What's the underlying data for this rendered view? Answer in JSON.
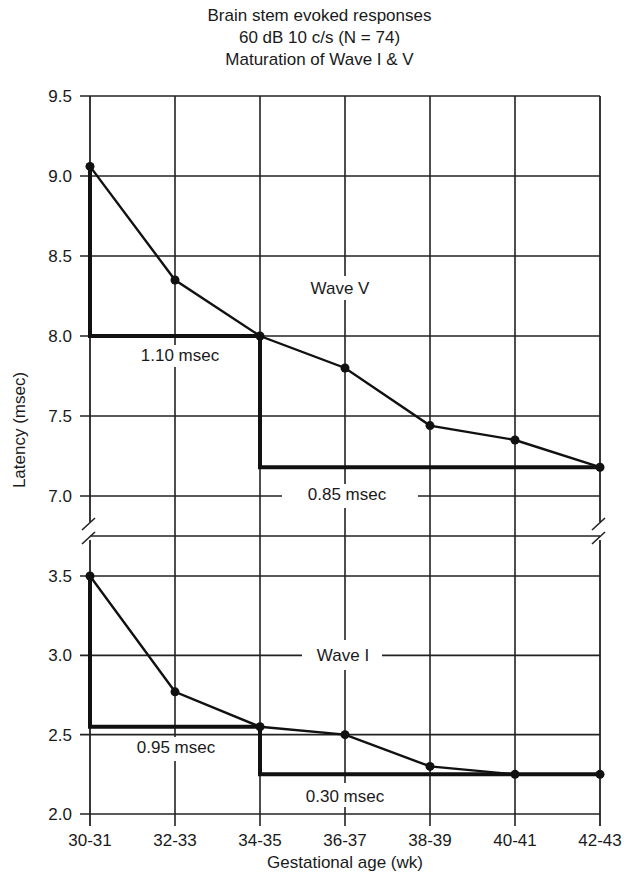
{
  "title": {
    "line1": "Brain stem evoked responses",
    "line2": "60 dB   10 c/s   (N = 74)",
    "line3": "Maturation of Wave I & V"
  },
  "axes": {
    "xlabel": "Gestational age (wk)",
    "ylabel": "Latency (msec)"
  },
  "annotations": {
    "wave_v_label": "Wave V",
    "wave_i_label": "Wave I",
    "wave_v_early_diff": "1.10 msec",
    "wave_v_late_diff": "0.85 msec",
    "wave_i_early_diff": "0.95 msec",
    "wave_i_late_diff": "0.30 msec"
  },
  "colors": {
    "line": "#111111",
    "grid": "#222222",
    "background": "#ffffff"
  },
  "chart_data": {
    "type": "line",
    "xlabel": "Gestational age (wk)",
    "ylabel": "Latency (msec)",
    "categories": [
      "30-31",
      "32-33",
      "34-35",
      "36-37",
      "38-39",
      "40-41",
      "42-43"
    ],
    "series": [
      {
        "name": "Wave V",
        "values": [
          9.06,
          8.35,
          8.0,
          7.8,
          7.44,
          7.35,
          7.18
        ]
      },
      {
        "name": "Wave I",
        "values": [
          3.5,
          2.77,
          2.55,
          2.5,
          2.3,
          2.25,
          2.25
        ]
      }
    ],
    "y_ticks_upper": [
      "9.5",
      "9.0",
      "8.5",
      "8.0",
      "7.5",
      "7.0"
    ],
    "y_ticks_lower": [
      "3.5",
      "3.0",
      "2.5",
      "2.0"
    ],
    "ylim_upper": [
      7.0,
      9.5
    ],
    "ylim_lower": [
      2.0,
      3.5
    ],
    "axis_break": "between 7.0 and 3.5",
    "grid": true,
    "legend": "none (series labeled inline: Wave V, Wave I)",
    "annotations": [
      {
        "text": "1.10 msec",
        "series": "Wave V",
        "from": "30-31",
        "to": "34-35",
        "drop": 1.1
      },
      {
        "text": "0.85 msec",
        "series": "Wave V",
        "from": "34-35",
        "to": "42-43",
        "drop": 0.85
      },
      {
        "text": "0.95 msec",
        "series": "Wave I",
        "from": "30-31",
        "to": "34-35",
        "drop": 0.95
      },
      {
        "text": "0.30 msec",
        "series": "Wave I",
        "from": "34-35",
        "to": "42-43",
        "drop": 0.3
      }
    ]
  }
}
